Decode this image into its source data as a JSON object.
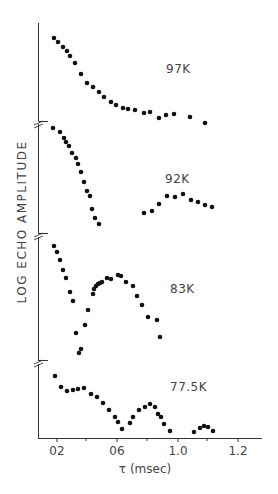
{
  "chart_data": {
    "type": "scatter",
    "title": "",
    "xlabel": "τ (msec)",
    "ylabel": "LOG ECHO AMPLITUDE",
    "x_tick_labels": [
      "0.2",
      "0.6",
      "1.0",
      "1.2"
    ],
    "x_tick_display": [
      "02",
      "06",
      "1.0",
      "1.2"
    ],
    "grid": false,
    "legend": null,
    "panels": [
      {
        "name": "97K",
        "label": "97K",
        "points": [
          [
            0.18,
            38
          ],
          [
            0.21,
            42
          ],
          [
            0.24,
            47
          ],
          [
            0.27,
            51
          ],
          [
            0.29,
            56
          ],
          [
            0.32,
            63
          ],
          [
            0.36,
            74
          ],
          [
            0.4,
            83
          ],
          [
            0.44,
            87
          ],
          [
            0.48,
            92
          ],
          [
            0.51,
            97
          ],
          [
            0.56,
            102
          ],
          [
            0.59,
            105
          ],
          [
            0.64,
            108
          ],
          [
            0.67,
            109
          ],
          [
            0.72,
            110
          ],
          [
            0.78,
            113
          ],
          [
            0.82,
            112
          ],
          [
            0.88,
            118
          ],
          [
            0.92,
            115
          ],
          [
            0.98,
            114
          ],
          [
            1.08,
            117
          ],
          [
            1.18,
            123
          ]
        ]
      },
      {
        "name": "92K",
        "label": "92K",
        "points": [
          [
            0.17,
            128
          ],
          [
            0.22,
            132
          ],
          [
            0.25,
            138
          ],
          [
            0.26,
            142
          ],
          [
            0.28,
            146
          ],
          [
            0.3,
            153
          ],
          [
            0.33,
            158
          ],
          [
            0.34,
            164
          ],
          [
            0.36,
            172
          ],
          [
            0.38,
            182
          ],
          [
            0.4,
            191
          ],
          [
            0.42,
            196
          ],
          [
            0.44,
            209
          ],
          [
            0.46,
            218
          ],
          [
            0.48,
            224
          ],
          [
            0.78,
            213
          ],
          [
            0.83,
            211
          ],
          [
            0.88,
            204
          ],
          [
            0.93,
            196
          ],
          [
            0.98,
            197
          ],
          [
            1.04,
            194
          ],
          [
            1.09,
            200
          ],
          [
            1.14,
            202
          ],
          [
            1.18,
            205
          ],
          [
            1.23,
            207
          ]
        ]
      },
      {
        "name": "83K",
        "label": "83K",
        "points": [
          [
            0.18,
            246
          ],
          [
            0.2,
            252
          ],
          [
            0.22,
            260
          ],
          [
            0.24,
            270
          ],
          [
            0.26,
            278
          ],
          [
            0.28,
            292
          ],
          [
            0.3,
            301
          ],
          [
            0.32,
            333
          ],
          [
            0.34,
            353
          ],
          [
            0.35,
            349
          ],
          [
            0.38,
            325
          ],
          [
            0.4,
            310
          ],
          [
            0.43,
            294
          ],
          [
            0.44,
            289
          ],
          [
            0.45,
            286
          ],
          [
            0.46,
            284
          ],
          [
            0.48,
            283
          ],
          [
            0.49,
            282
          ],
          [
            0.52,
            278
          ],
          [
            0.55,
            279
          ],
          [
            0.6,
            275
          ],
          [
            0.62,
            276
          ],
          [
            0.65,
            282
          ],
          [
            0.7,
            286
          ],
          [
            0.72,
            296
          ],
          [
            0.76,
            305
          ],
          [
            0.8,
            317
          ],
          [
            0.86,
            320
          ],
          [
            0.88,
            337
          ]
        ]
      },
      {
        "name": "77.5K",
        "label": "77.5K",
        "points": [
          [
            0.19,
            376
          ],
          [
            0.23,
            387
          ],
          [
            0.27,
            391
          ],
          [
            0.3,
            390
          ],
          [
            0.34,
            389
          ],
          [
            0.38,
            388
          ],
          [
            0.42,
            394
          ],
          [
            0.46,
            397
          ],
          [
            0.5,
            403
          ],
          [
            0.54,
            410
          ],
          [
            0.58,
            417
          ],
          [
            0.6,
            422
          ],
          [
            0.63,
            429
          ],
          [
            0.68,
            423
          ],
          [
            0.7,
            417
          ],
          [
            0.74,
            410
          ],
          [
            0.78,
            407
          ],
          [
            0.82,
            404
          ],
          [
            0.85,
            407
          ],
          [
            0.87,
            414
          ],
          [
            0.89,
            417
          ],
          [
            0.91,
            424
          ],
          [
            0.95,
            431
          ],
          [
            1.11,
            432
          ],
          [
            1.15,
            428
          ],
          [
            1.18,
            426
          ],
          [
            1.2,
            427
          ],
          [
            1.24,
            431
          ]
        ]
      }
    ],
    "note": "y values are pixel positions (log-amplitude scale, offset per panel, axis breaks between panels); x in msec"
  },
  "axis": {
    "ylabel": "LOG ECHO AMPLITUDE",
    "xlabel": "τ (msec)",
    "ticks": [
      {
        "label": "02",
        "x": 57
      },
      {
        "label": "06",
        "x": 117
      },
      {
        "label": "1.0",
        "x": 178
      },
      {
        "label": "1.2",
        "x": 238
      }
    ]
  },
  "panels": [
    {
      "label": "97K",
      "label_x": 166,
      "label_y": 62
    },
    {
      "label": "92K",
      "label_x": 165,
      "label_y": 172
    },
    {
      "label": "83K",
      "label_x": 170,
      "label_y": 282
    },
    {
      "label": "77.5K",
      "label_x": 170,
      "label_y": 380
    }
  ],
  "pixel_points": [
    [
      [
        54,
        38
      ],
      [
        58,
        42
      ],
      [
        63,
        47
      ],
      [
        67,
        51
      ],
      [
        70,
        56
      ],
      [
        75,
        63
      ],
      [
        81,
        74
      ],
      [
        87,
        83
      ],
      [
        93,
        87
      ],
      [
        99,
        92
      ],
      [
        104,
        97
      ],
      [
        111,
        102
      ],
      [
        116,
        105
      ],
      [
        123,
        108
      ],
      [
        128,
        109
      ],
      [
        135,
        110
      ],
      [
        144,
        113
      ],
      [
        150,
        112
      ],
      [
        159,
        118
      ],
      [
        166,
        115
      ],
      [
        174,
        114
      ],
      [
        190,
        117
      ],
      [
        205,
        123
      ]
    ],
    [
      [
        53,
        128
      ],
      [
        60,
        132
      ],
      [
        64,
        138
      ],
      [
        66,
        142
      ],
      [
        69,
        146
      ],
      [
        72,
        153
      ],
      [
        76,
        158
      ],
      [
        78,
        164
      ],
      [
        81,
        172
      ],
      [
        84,
        182
      ],
      [
        87,
        191
      ],
      [
        90,
        196
      ],
      [
        92,
        209
      ],
      [
        95,
        218
      ],
      [
        99,
        224
      ],
      [
        144,
        213
      ],
      [
        152,
        211
      ],
      [
        159,
        204
      ],
      [
        167,
        196
      ],
      [
        175,
        197
      ],
      [
        183,
        194
      ],
      [
        191,
        200
      ],
      [
        198,
        202
      ],
      [
        205,
        205
      ],
      [
        212,
        207
      ]
    ],
    [
      [
        54,
        246
      ],
      [
        57,
        252
      ],
      [
        60,
        260
      ],
      [
        63,
        270
      ],
      [
        66,
        278
      ],
      [
        70,
        292
      ],
      [
        73,
        301
      ],
      [
        76,
        333
      ],
      [
        79,
        353
      ],
      [
        81,
        349
      ],
      [
        85,
        325
      ],
      [
        88,
        310
      ],
      [
        93,
        294
      ],
      [
        94,
        289
      ],
      [
        96,
        286
      ],
      [
        98,
        284
      ],
      [
        100,
        283
      ],
      [
        102,
        282
      ],
      [
        107,
        278
      ],
      [
        111,
        279
      ],
      [
        118,
        275
      ],
      [
        121,
        276
      ],
      [
        126,
        282
      ],
      [
        133,
        286
      ],
      [
        137,
        296
      ],
      [
        142,
        305
      ],
      [
        148,
        317
      ],
      [
        157,
        320
      ],
      [
        160,
        337
      ]
    ],
    [
      [
        55,
        376
      ],
      [
        61,
        387
      ],
      [
        67,
        391
      ],
      [
        73,
        390
      ],
      [
        78,
        389
      ],
      [
        84,
        388
      ],
      [
        91,
        394
      ],
      [
        97,
        397
      ],
      [
        103,
        403
      ],
      [
        109,
        410
      ],
      [
        115,
        417
      ],
      [
        118,
        422
      ],
      [
        122,
        429
      ],
      [
        130,
        423
      ],
      [
        133,
        417
      ],
      [
        139,
        410
      ],
      [
        145,
        407
      ],
      [
        150,
        404
      ],
      [
        155,
        407
      ],
      [
        158,
        414
      ],
      [
        161,
        417
      ],
      [
        164,
        424
      ],
      [
        170,
        431
      ],
      [
        194,
        432
      ],
      [
        200,
        428
      ],
      [
        204,
        426
      ],
      [
        208,
        427
      ],
      [
        213,
        431
      ]
    ]
  ]
}
